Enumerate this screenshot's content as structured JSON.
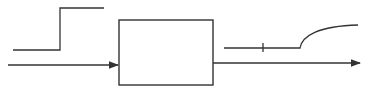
{
  "diagram": {
    "type": "block-diagram",
    "stroke_color": "#333333",
    "background": "#ffffff",
    "input_signal": {
      "shape": "step",
      "low_level_y": 50,
      "high_level_y": 8,
      "step_x": 60
    },
    "system_block": {
      "label": "",
      "x": 118,
      "y": 20,
      "width": 95,
      "height": 65
    },
    "output_signal": {
      "shape": "delayed-exponential-rise",
      "delay_marker_x": 263,
      "rise_start_x": 300
    }
  }
}
